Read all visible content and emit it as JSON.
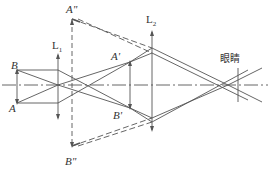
{
  "diagram": {
    "type": "optical ray diagram",
    "labels": {
      "A_double_prime": "A\"",
      "B_double_prime": "B\"",
      "A_prime": "A'",
      "B_prime": "B'",
      "A": "A",
      "B": "B",
      "L1": "L",
      "L1_sub": "1",
      "L2": "L",
      "L2_sub": "2",
      "eye": "眼睛"
    },
    "colors": {
      "line": "#555555",
      "text": "#333333",
      "background": "#ffffff"
    }
  }
}
